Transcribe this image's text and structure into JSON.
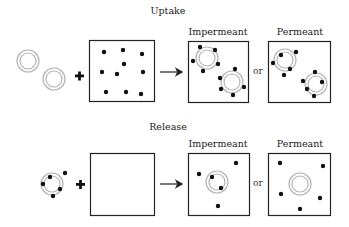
{
  "diagram": {
    "sections": [
      {
        "title": "Uptake",
        "outcomes": [
          {
            "label": "Impermeant"
          },
          {
            "label": "Permeant"
          }
        ],
        "separator": "or"
      },
      {
        "title": "Release",
        "outcomes": [
          {
            "label": "Impermeant"
          },
          {
            "label": "Permeant"
          }
        ],
        "separator": "or"
      }
    ],
    "colors": {
      "ring": "#b0b0b0",
      "dot": "#111111",
      "box": "#222222"
    }
  }
}
